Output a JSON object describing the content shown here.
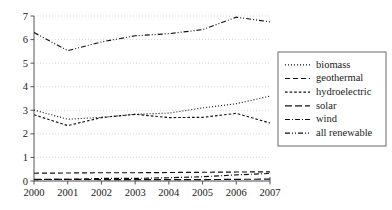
{
  "chart_data": {
    "type": "line",
    "title": "",
    "xlabel": "",
    "ylabel": "",
    "categories": [
      "2000",
      "2001",
      "2002",
      "2003",
      "2004",
      "2005",
      "2006",
      "2007"
    ],
    "x": [
      2000,
      2001,
      2002,
      2003,
      2004,
      2005,
      2006,
      2007
    ],
    "xlim": [
      2000,
      2007
    ],
    "ylim": [
      0,
      7
    ],
    "yticks": [
      0,
      1,
      2,
      3,
      4,
      5,
      6,
      7
    ],
    "ytick_labels": [
      "0",
      "1",
      "2",
      "3",
      "4",
      "5",
      "6",
      "7"
    ],
    "xtick_labels": [
      "2000",
      "2001",
      "2002",
      "2003",
      "2004",
      "2005",
      "2006",
      "2007"
    ],
    "grid": true,
    "grid_axis": "y",
    "legend_position": "right-outside",
    "series": [
      {
        "name": "biomass",
        "dash": "1,2",
        "values": [
          3.01,
          2.62,
          2.7,
          2.83,
          2.88,
          3.1,
          3.28,
          3.6
        ]
      },
      {
        "name": "geothermal",
        "dash": "5,3",
        "values": [
          0.33,
          0.34,
          0.35,
          0.35,
          0.36,
          0.37,
          0.38,
          0.39
        ]
      },
      {
        "name": "hydroelectric",
        "dash": "2.6,2",
        "values": [
          2.81,
          2.35,
          2.69,
          2.83,
          2.69,
          2.7,
          2.87,
          2.46
        ]
      },
      {
        "name": "solar",
        "dash": "7,3",
        "values": [
          0.07,
          0.07,
          0.06,
          0.06,
          0.06,
          0.06,
          0.07,
          0.08
        ]
      },
      {
        "name": "wind",
        "dash": "5,2,1,2",
        "values": [
          0.06,
          0.07,
          0.11,
          0.11,
          0.14,
          0.18,
          0.26,
          0.32
        ]
      },
      {
        "name": "all renewable",
        "dash": "5,2,1,2,1,2",
        "values": [
          6.3,
          5.53,
          5.9,
          6.16,
          6.25,
          6.42,
          6.95,
          6.75
        ]
      }
    ]
  },
  "legend": {
    "entries": [
      {
        "label": "biomass"
      },
      {
        "label": "geothermal"
      },
      {
        "label": "hydroelectric"
      },
      {
        "label": "solar"
      },
      {
        "label": "wind"
      },
      {
        "label": "all renewable"
      }
    ]
  }
}
